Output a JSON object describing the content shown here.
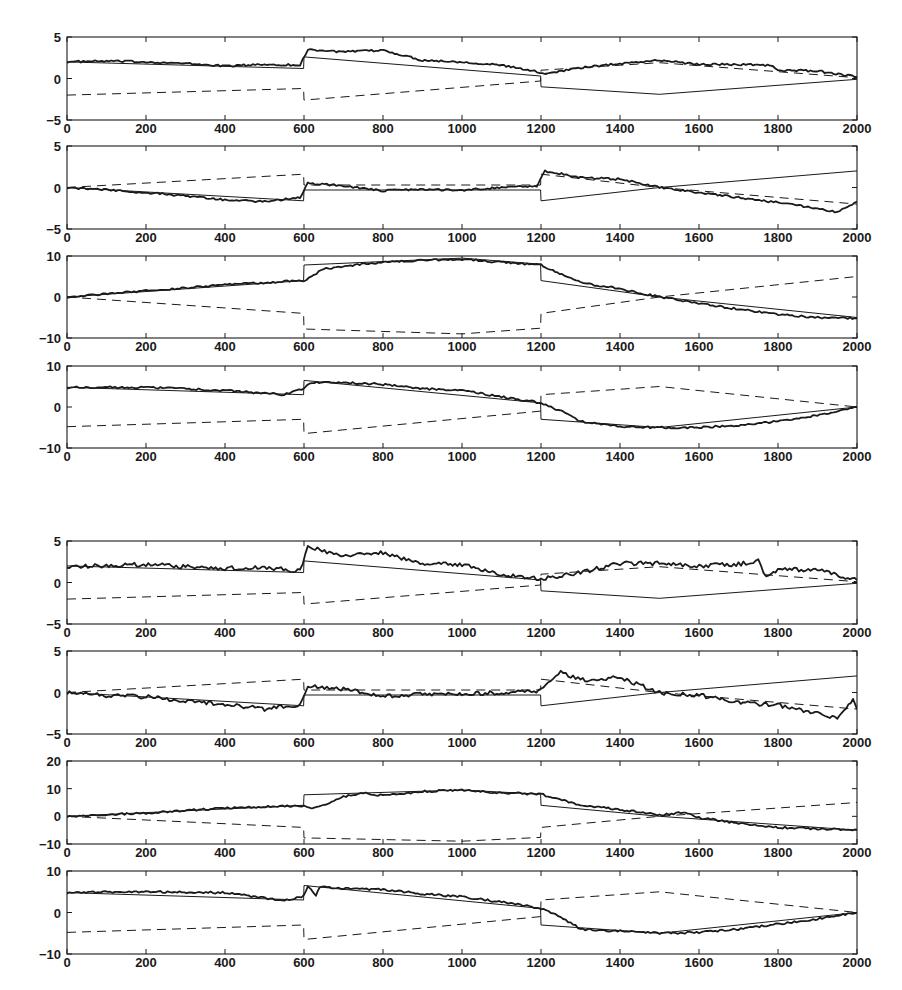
{
  "figure": {
    "groups": [
      {
        "name": "group-top",
        "label": ""
      },
      {
        "name": "group-bottom",
        "label": ""
      }
    ]
  },
  "colors": {
    "ink": "#1a1a1a",
    "background": "#ffffff"
  },
  "chart_data": [
    {
      "type": "line",
      "panel": 1,
      "group": "top",
      "title": "",
      "xlabel": "",
      "ylabel": "",
      "xlim": [
        0,
        2000
      ],
      "ylim": [
        -5,
        5
      ],
      "xticks": [
        0,
        200,
        400,
        600,
        800,
        1000,
        1200,
        1400,
        1600,
        1800,
        2000
      ],
      "yticks": [
        -5,
        0,
        5
      ],
      "grid": false,
      "x": [
        0,
        600,
        600,
        1200,
        1200,
        1500,
        2000
      ],
      "series": [
        {
          "name": "true-solid",
          "style": "solid-thin",
          "x": [
            0,
            599,
            600,
            1199,
            1200,
            1500,
            2000
          ],
          "values": [
            2.0,
            1.2,
            2.6,
            0.3,
            -1.0,
            -1.9,
            -0.1
          ]
        },
        {
          "name": "true-dashed",
          "style": "dashed",
          "x": [
            0,
            599,
            600,
            1199,
            1200,
            1500,
            2000
          ],
          "values": [
            -2.0,
            -1.2,
            -2.6,
            -0.3,
            1.0,
            1.9,
            0.1
          ]
        },
        {
          "name": "estimate",
          "style": "solid-thick",
          "x": [
            0,
            100,
            200,
            300,
            400,
            500,
            590,
            610,
            700,
            800,
            900,
            1000,
            1100,
            1190,
            1210,
            1300,
            1400,
            1500,
            1600,
            1700,
            1780,
            1800,
            1900,
            2000
          ],
          "values": [
            2.0,
            2.1,
            2.0,
            1.8,
            1.5,
            1.7,
            1.6,
            3.5,
            3.2,
            3.4,
            2.2,
            2.0,
            1.6,
            0.8,
            0.6,
            1.3,
            1.8,
            2.2,
            1.7,
            1.7,
            1.6,
            1.0,
            0.9,
            0.2
          ]
        }
      ]
    },
    {
      "type": "line",
      "panel": 2,
      "group": "top",
      "title": "",
      "xlabel": "",
      "ylabel": "",
      "xlim": [
        0,
        2000
      ],
      "ylim": [
        -5,
        5
      ],
      "xticks": [
        0,
        200,
        400,
        600,
        800,
        1000,
        1200,
        1400,
        1600,
        1800,
        2000
      ],
      "yticks": [
        -5,
        0,
        5
      ],
      "grid": false,
      "series": [
        {
          "name": "true-solid",
          "style": "solid-thin",
          "x": [
            0,
            599,
            600,
            1199,
            1200,
            1500,
            2000
          ],
          "values": [
            0.0,
            -1.6,
            -0.3,
            -0.3,
            -1.6,
            0.0,
            2.0
          ]
        },
        {
          "name": "true-dashed",
          "style": "dashed",
          "x": [
            0,
            599,
            600,
            1199,
            1200,
            1500,
            2000
          ],
          "values": [
            0.0,
            1.6,
            0.3,
            0.3,
            1.6,
            0.0,
            -2.0
          ]
        },
        {
          "name": "estimate",
          "style": "solid-thick",
          "x": [
            0,
            100,
            200,
            300,
            400,
            500,
            590,
            610,
            700,
            800,
            900,
            1000,
            1100,
            1190,
            1210,
            1300,
            1400,
            1500,
            1600,
            1700,
            1800,
            1900,
            1950,
            2000
          ],
          "values": [
            0.0,
            -0.3,
            -0.6,
            -1.0,
            -1.5,
            -1.7,
            -1.2,
            0.5,
            0.2,
            -0.4,
            -0.2,
            -0.3,
            0.0,
            0.2,
            2.0,
            1.2,
            1.0,
            0.0,
            -0.6,
            -1.2,
            -1.8,
            -2.5,
            -3.0,
            -1.7
          ]
        }
      ]
    },
    {
      "type": "line",
      "panel": 3,
      "group": "top",
      "title": "",
      "xlabel": "",
      "ylabel": "",
      "xlim": [
        0,
        2000
      ],
      "ylim": [
        -10,
        10
      ],
      "xticks": [
        0,
        200,
        400,
        600,
        800,
        1000,
        1200,
        1400,
        1600,
        1800,
        2000
      ],
      "yticks": [
        -10,
        0,
        10
      ],
      "grid": false,
      "series": [
        {
          "name": "true-solid",
          "style": "solid-thin",
          "x": [
            0,
            599,
            600,
            1000,
            1199,
            1200,
            1500,
            2000
          ],
          "values": [
            0.0,
            4.0,
            7.8,
            9.5,
            8.0,
            4.0,
            0.0,
            -5.0
          ]
        },
        {
          "name": "true-dashed",
          "style": "dashed",
          "x": [
            0,
            599,
            600,
            1000,
            1199,
            1200,
            1500,
            2000
          ],
          "values": [
            0.0,
            -4.0,
            -7.8,
            -9.0,
            -7.6,
            -4.0,
            0.0,
            5.0
          ]
        },
        {
          "name": "estimate",
          "style": "solid-thick",
          "x": [
            0,
            200,
            400,
            600,
            650,
            700,
            800,
            900,
            1000,
            1100,
            1200,
            1300,
            1400,
            1500,
            1600,
            1700,
            1800,
            1900,
            2000
          ],
          "values": [
            0.0,
            1.5,
            3.0,
            4.0,
            6.8,
            7.5,
            8.5,
            9.0,
            9.2,
            8.5,
            7.8,
            3.5,
            2.0,
            0.0,
            -1.5,
            -3.0,
            -4.2,
            -5.0,
            -5.2
          ]
        }
      ]
    },
    {
      "type": "line",
      "panel": 4,
      "group": "top",
      "title": "",
      "xlabel": "",
      "ylabel": "",
      "xlim": [
        0,
        2000
      ],
      "ylim": [
        -10,
        10
      ],
      "xticks": [
        0,
        200,
        400,
        600,
        800,
        1000,
        1200,
        1400,
        1600,
        1800,
        2000
      ],
      "yticks": [
        -10,
        0,
        10
      ],
      "grid": false,
      "series": [
        {
          "name": "true-solid",
          "style": "solid-thin",
          "x": [
            0,
            599,
            600,
            1199,
            1200,
            1500,
            2000
          ],
          "values": [
            4.8,
            3.0,
            6.5,
            1.0,
            -3.0,
            -5.0,
            0.0
          ]
        },
        {
          "name": "true-dashed",
          "style": "dashed",
          "x": [
            0,
            599,
            600,
            1199,
            1200,
            1500,
            2000
          ],
          "values": [
            -4.8,
            -3.0,
            -6.5,
            -1.0,
            3.0,
            5.0,
            0.0
          ]
        },
        {
          "name": "estimate",
          "style": "solid-thick",
          "x": [
            0,
            200,
            400,
            550,
            600,
            620,
            700,
            800,
            900,
            1000,
            1100,
            1200,
            1250,
            1300,
            1400,
            1500,
            1600,
            1700,
            1800,
            1900,
            2000
          ],
          "values": [
            4.8,
            4.8,
            4.0,
            3.0,
            4.5,
            6.0,
            6.0,
            5.5,
            4.5,
            4.0,
            2.5,
            1.0,
            -1.0,
            -3.5,
            -4.8,
            -5.0,
            -5.0,
            -4.5,
            -3.5,
            -2.0,
            0.0
          ]
        }
      ]
    },
    {
      "type": "line",
      "panel": 5,
      "group": "bottom",
      "title": "",
      "xlabel": "",
      "ylabel": "",
      "xlim": [
        0,
        2000
      ],
      "ylim": [
        -5,
        5
      ],
      "xticks": [
        0,
        200,
        400,
        600,
        800,
        1000,
        1200,
        1400,
        1600,
        1800,
        2000
      ],
      "yticks": [
        -5,
        0,
        5
      ],
      "grid": false,
      "series": [
        {
          "name": "true-solid",
          "style": "solid-thin",
          "x": [
            0,
            599,
            600,
            1199,
            1200,
            1500,
            2000
          ],
          "values": [
            2.0,
            1.2,
            2.6,
            0.3,
            -1.0,
            -1.9,
            -0.1
          ]
        },
        {
          "name": "true-dashed",
          "style": "dashed",
          "x": [
            0,
            599,
            600,
            1199,
            1200,
            1500,
            2000
          ],
          "values": [
            -2.0,
            -1.2,
            -2.6,
            -0.3,
            1.0,
            1.9,
            0.1
          ]
        },
        {
          "name": "estimate",
          "style": "solid-thick",
          "x": [
            0,
            100,
            200,
            300,
            400,
            500,
            590,
            610,
            700,
            800,
            900,
            1000,
            1100,
            1200,
            1300,
            1400,
            1500,
            1600,
            1700,
            1750,
            1770,
            1800,
            1900,
            2000
          ],
          "values": [
            2.0,
            2.0,
            2.2,
            1.9,
            1.7,
            1.8,
            1.4,
            4.3,
            3.2,
            3.6,
            2.2,
            2.2,
            1.0,
            0.4,
            1.2,
            2.3,
            2.3,
            2.0,
            2.2,
            2.6,
            0.8,
            1.5,
            1.6,
            0.3
          ]
        }
      ]
    },
    {
      "type": "line",
      "panel": 6,
      "group": "bottom",
      "title": "",
      "xlabel": "",
      "ylabel": "",
      "xlim": [
        0,
        2000
      ],
      "ylim": [
        -5,
        5
      ],
      "xticks": [
        0,
        200,
        400,
        600,
        800,
        1000,
        1200,
        1400,
        1600,
        1800,
        2000
      ],
      "yticks": [
        -5,
        0,
        5
      ],
      "grid": false,
      "series": [
        {
          "name": "true-solid",
          "style": "solid-thin",
          "x": [
            0,
            599,
            600,
            1199,
            1200,
            1500,
            2000
          ],
          "values": [
            0.0,
            -1.6,
            -0.3,
            -0.3,
            -1.6,
            0.0,
            2.0
          ]
        },
        {
          "name": "true-dashed",
          "style": "dashed",
          "x": [
            0,
            599,
            600,
            1199,
            1200,
            1500,
            2000
          ],
          "values": [
            0.0,
            1.6,
            0.3,
            0.3,
            1.6,
            0.0,
            -2.0
          ]
        },
        {
          "name": "estimate",
          "style": "solid-thick",
          "x": [
            0,
            100,
            200,
            300,
            400,
            500,
            590,
            610,
            700,
            800,
            900,
            1000,
            1100,
            1200,
            1250,
            1300,
            1400,
            1500,
            1600,
            1700,
            1800,
            1900,
            1950,
            1990,
            2000
          ],
          "values": [
            0.0,
            -0.4,
            -0.5,
            -1.0,
            -1.4,
            -2.0,
            -1.5,
            0.8,
            0.4,
            -0.4,
            -0.2,
            -0.2,
            0.0,
            0.2,
            2.5,
            1.5,
            1.8,
            0.0,
            -0.3,
            -1.2,
            -1.5,
            -2.5,
            -3.2,
            -1.0,
            -2.0
          ]
        }
      ]
    },
    {
      "type": "line",
      "panel": 7,
      "group": "bottom",
      "title": "",
      "xlabel": "",
      "ylabel": "",
      "xlim": [
        0,
        2000
      ],
      "ylim": [
        -10,
        20
      ],
      "xticks": [
        0,
        200,
        400,
        600,
        800,
        1000,
        1200,
        1400,
        1600,
        1800,
        2000
      ],
      "yticks": [
        -10,
        0,
        10,
        20
      ],
      "grid": false,
      "series": [
        {
          "name": "true-solid",
          "style": "solid-thin",
          "x": [
            0,
            599,
            600,
            1000,
            1199,
            1200,
            1500,
            2000
          ],
          "values": [
            0.0,
            4.0,
            7.8,
            9.5,
            8.0,
            4.0,
            0.0,
            -5.0
          ]
        },
        {
          "name": "true-dashed",
          "style": "dashed",
          "x": [
            0,
            599,
            600,
            1000,
            1199,
            1200,
            1500,
            2000
          ],
          "values": [
            0.0,
            -4.0,
            -7.8,
            -9.0,
            -7.6,
            -4.0,
            0.0,
            5.0
          ]
        },
        {
          "name": "estimate",
          "style": "solid-thick",
          "x": [
            0,
            200,
            400,
            600,
            620,
            700,
            750,
            800,
            900,
            1000,
            1100,
            1200,
            1300,
            1400,
            1500,
            1560,
            1600,
            1700,
            1800,
            1900,
            2000
          ],
          "values": [
            0.0,
            1.2,
            3.0,
            3.8,
            2.5,
            7.0,
            8.5,
            7.5,
            9.0,
            9.5,
            8.5,
            8.0,
            4.0,
            2.5,
            0.5,
            1.5,
            -0.5,
            -2.5,
            -4.0,
            -4.5,
            -4.8
          ]
        }
      ]
    },
    {
      "type": "line",
      "panel": 8,
      "group": "bottom",
      "title": "",
      "xlabel": "",
      "ylabel": "",
      "xlim": [
        0,
        2000
      ],
      "ylim": [
        -10,
        10
      ],
      "xticks": [
        0,
        200,
        400,
        600,
        800,
        1000,
        1200,
        1400,
        1600,
        1800,
        2000
      ],
      "yticks": [
        -10,
        0,
        10
      ],
      "grid": false,
      "series": [
        {
          "name": "true-solid",
          "style": "solid-thin",
          "x": [
            0,
            599,
            600,
            1199,
            1200,
            1500,
            2000
          ],
          "values": [
            4.8,
            3.0,
            6.5,
            1.0,
            -3.0,
            -5.0,
            0.0
          ]
        },
        {
          "name": "true-dashed",
          "style": "dashed",
          "x": [
            0,
            599,
            600,
            1199,
            1200,
            1500,
            2000
          ],
          "values": [
            -4.8,
            -3.0,
            -6.5,
            -1.0,
            3.0,
            5.0,
            0.0
          ]
        },
        {
          "name": "estimate",
          "style": "solid-thick",
          "x": [
            0,
            200,
            400,
            550,
            600,
            610,
            630,
            640,
            700,
            800,
            900,
            1000,
            1100,
            1200,
            1250,
            1300,
            1400,
            1500,
            1600,
            1700,
            1800,
            1900,
            2000
          ],
          "values": [
            4.8,
            5.0,
            4.8,
            2.8,
            4.0,
            6.5,
            4.0,
            6.2,
            5.8,
            5.5,
            4.5,
            3.8,
            2.5,
            1.0,
            -1.0,
            -4.0,
            -4.5,
            -5.0,
            -4.8,
            -4.0,
            -2.8,
            -1.5,
            0.0
          ]
        }
      ]
    }
  ]
}
